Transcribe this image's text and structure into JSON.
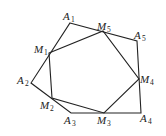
{
  "diagram": {
    "title": "",
    "outer_polygon": [
      "A1",
      "A5",
      "A4",
      "A3",
      "A2"
    ],
    "inner_polygon": [
      "M1",
      "M5",
      "M4",
      "M3",
      "M2"
    ],
    "points": {
      "A1": {
        "x": 70,
        "y": 23,
        "label": "A",
        "sub": "1"
      },
      "A2": {
        "x": 31,
        "y": 83,
        "label": "A",
        "sub": "2"
      },
      "A3": {
        "x": 71,
        "y": 113,
        "label": "A",
        "sub": "3"
      },
      "A4": {
        "x": 141,
        "y": 113,
        "label": "A",
        "sub": "4"
      },
      "A5": {
        "x": 137,
        "y": 41,
        "label": "A",
        "sub": "5"
      },
      "M1": {
        "x": 49,
        "y": 53,
        "label": "M",
        "sub": "1"
      },
      "M2": {
        "x": 52,
        "y": 98,
        "label": "M",
        "sub": "2"
      },
      "M3": {
        "x": 104,
        "y": 113,
        "label": "M",
        "sub": "3"
      },
      "M4": {
        "x": 139,
        "y": 79,
        "label": "M",
        "sub": "4"
      },
      "M5": {
        "x": 103,
        "y": 31,
        "label": "M",
        "sub": "5"
      }
    }
  }
}
